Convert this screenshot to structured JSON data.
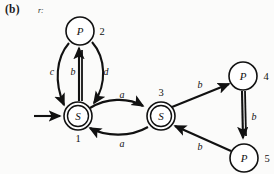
{
  "figure": {
    "caption": "(b)",
    "sublabel": "r:"
  },
  "diagram": {
    "type": "state-machine",
    "nodes": [
      {
        "id": "n2",
        "label": "P",
        "index": "2",
        "kind": "single-circle",
        "cx": 80,
        "cy": 31,
        "r": 14,
        "index_dx": 22,
        "index_dy": 4
      },
      {
        "id": "n1",
        "label": "S",
        "index": "1",
        "kind": "double-circle",
        "cx": 78,
        "cy": 116,
        "r": 14,
        "index_dx": 0,
        "index_dy": 26
      },
      {
        "id": "n3",
        "label": "S",
        "index": "3",
        "kind": "double-circle",
        "cx": 161,
        "cy": 116,
        "r": 14,
        "index_dx": 0,
        "index_dy": -20
      },
      {
        "id": "n4",
        "label": "P",
        "index": "4",
        "kind": "single-circle",
        "cx": 243,
        "cy": 76,
        "r": 14,
        "index_dx": 23,
        "index_dy": 4
      },
      {
        "id": "n5",
        "label": "P",
        "index": "5",
        "kind": "single-circle",
        "cx": 244,
        "cy": 158,
        "r": 14,
        "index_dx": 23,
        "index_dy": 4
      }
    ],
    "edges": [
      {
        "id": "e-start",
        "from": "start",
        "to": "n1",
        "label": "",
        "shape": "start-arrow"
      },
      {
        "id": "e-c",
        "from": "n2",
        "to": "n1",
        "label": "c",
        "lx": 52,
        "ly": 72
      },
      {
        "id": "e-b1",
        "from": "n1",
        "to": "n2",
        "label": "b",
        "lx": 74,
        "ly": 72
      },
      {
        "id": "e-d",
        "from": "n2",
        "to": "n1",
        "label": "d",
        "lx": 106,
        "ly": 72
      },
      {
        "id": "e-a1",
        "from": "n1",
        "to": "n3",
        "label": "a",
        "lx": 122,
        "ly": 96
      },
      {
        "id": "e-a2",
        "from": "n3",
        "to": "n1",
        "label": "a",
        "lx": 122,
        "ly": 143
      },
      {
        "id": "e-b2",
        "from": "n3",
        "to": "n4",
        "label": "b",
        "lx": 200,
        "ly": 89
      },
      {
        "id": "e-b3",
        "from": "n4",
        "to": "n5",
        "label": "b",
        "lx": 252,
        "ly": 118
      },
      {
        "id": "e-b4",
        "from": "n5",
        "to": "n3",
        "label": "b",
        "lx": 200,
        "ly": 147
      }
    ]
  },
  "colors": {
    "ink": "#111111",
    "paper": "#fbfbfa"
  }
}
